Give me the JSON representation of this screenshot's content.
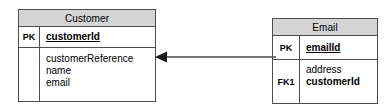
{
  "diagram": {
    "type": "entity-relationship-diagram",
    "background_color": "#ffffff",
    "entity_header_fill": "#d4d4d4",
    "border_color": "#4d4d4d",
    "text_color": "#000000",
    "entities": [
      {
        "id": "customer",
        "title": "Customer",
        "rows": [
          {
            "key_label": "PK",
            "fields": [
              {
                "name": "customerId",
                "style": "primary-key"
              }
            ]
          },
          {
            "key_label": "",
            "fields": [
              {
                "name": "customerReference",
                "style": "plain"
              },
              {
                "name": "name",
                "style": "plain"
              },
              {
                "name": "email",
                "style": "plain"
              }
            ]
          }
        ]
      },
      {
        "id": "email",
        "title": "Email",
        "rows": [
          {
            "key_label": "PK",
            "fields": [
              {
                "name": "emailId",
                "style": "primary-key"
              }
            ]
          },
          {
            "key_label": "FK1",
            "fields": [
              {
                "name": "address",
                "style": "plain"
              },
              {
                "name": "customerId",
                "style": "foreign-key"
              }
            ]
          }
        ]
      }
    ],
    "relationship": {
      "from": "email",
      "to": "customer",
      "line_style": "solid",
      "arrow_head": "filled-triangle",
      "arrow_direction": "left",
      "label": "",
      "color": "#4d4d4d"
    }
  },
  "entity_customer": {
    "title": "Customer",
    "pk_label": "PK",
    "pk_field": "customerId",
    "attr_label": "",
    "attr_1": "customerReference",
    "attr_2": "name",
    "attr_3": "email"
  },
  "entity_email": {
    "title": "Email",
    "pk_label": "PK",
    "pk_field": "emailId",
    "fk_label": "FK1",
    "attr_1": "address",
    "fk_field": "customerId"
  }
}
